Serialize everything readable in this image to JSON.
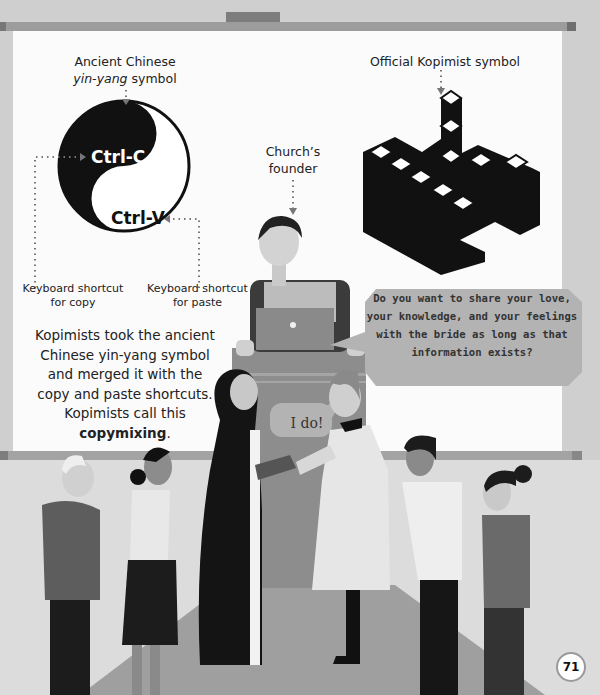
{
  "page": {
    "number": "71"
  },
  "yin_yang": {
    "caption_line1": "Ancient Chinese",
    "caption_italic": "yin-yang",
    "caption_rest": " symbol",
    "copy_label": "Ctrl-C",
    "paste_label": "Ctrl-V",
    "copy_caption_line1": "Keyboard shortcut",
    "copy_caption_line2": "for copy",
    "paste_caption_line1": "Keyboard shortcut",
    "paste_caption_line2": "for paste"
  },
  "kopimist_symbol": {
    "caption": "Official Kopimist symbol"
  },
  "founder": {
    "caption_line1": "Church’s",
    "caption_line2": "founder"
  },
  "explanation": {
    "lines": [
      "Kopimists took the ancient",
      "Chinese yin-yang symbol",
      "and merged it with the",
      "copy and paste shortcuts.",
      "Kopimists call this"
    ],
    "bold_term": "copymixing",
    "suffix": "."
  },
  "speech": {
    "founder_question_lines": [
      "Do you want to share your love,",
      "your knowledge, and your feelings",
      "with the bride as long as that",
      "information exists?"
    ],
    "groom_reply": "I do!"
  },
  "colors": {
    "page_bg": "#cfcfcf",
    "screen": "#fbfbfb",
    "roller_bar": "#9a9a9a",
    "bubble": "#b3b3b3",
    "ink": "#111111"
  }
}
